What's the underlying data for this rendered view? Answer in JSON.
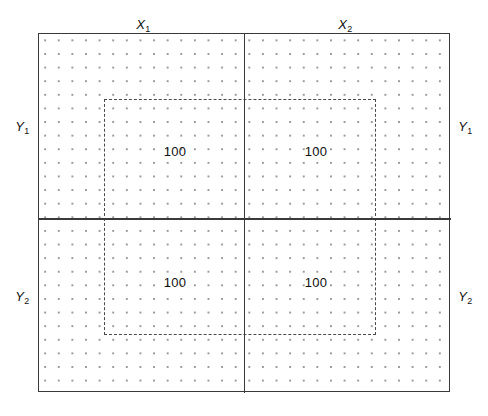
{
  "diagram": {
    "frame": {
      "name": "outer-frame",
      "line_color": "#3a3a3a"
    },
    "grid": {
      "name": "dot-grid",
      "dot_color": "#9a9a9a",
      "spacing_px": 13.62
    },
    "inner_zone": {
      "name": "inner-dashed-rectangle",
      "line_style": "dashed",
      "line_color": "#4a4a4a"
    },
    "axes": {
      "vertical_label_top": "X",
      "horizontal_label_left": "Y"
    },
    "labels": {
      "x1": "X",
      "x1_sub": "1",
      "x2": "X",
      "x2_sub": "2",
      "y1_left": "Y",
      "y1_left_sub": "1",
      "y2_left": "Y",
      "y2_left_sub": "2",
      "y1_right": "Y",
      "y1_right_sub": "1",
      "y2_right": "Y",
      "y2_right_sub": "2"
    },
    "quadrants": [
      {
        "id": "top-left",
        "value": "100"
      },
      {
        "id": "top-right",
        "value": "100"
      },
      {
        "id": "bottom-left",
        "value": "100"
      },
      {
        "id": "bottom-right",
        "value": "100"
      }
    ]
  }
}
